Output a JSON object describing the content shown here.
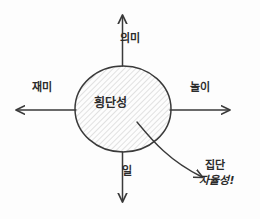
{
  "diagram": {
    "title_center": "횡단성",
    "axes": {
      "top": {
        "label": "의미",
        "icon": "arrow-up-icon"
      },
      "bottom": {
        "label": "일",
        "icon": "arrow-down-icon"
      },
      "left": {
        "label": "재미",
        "icon": "arrow-left-icon"
      },
      "right": {
        "label": "놀이",
        "icon": "arrow-right-icon"
      }
    },
    "annotation": {
      "line1": "집단",
      "line2": "자율성!",
      "pointer_icon": "curved-arrow-icon"
    },
    "style": {
      "stroke_color": "#3a3a3a",
      "hatch_color": "#c8c8c8",
      "text_color": "#2b2b2b",
      "background": "#fdfdfd"
    }
  }
}
